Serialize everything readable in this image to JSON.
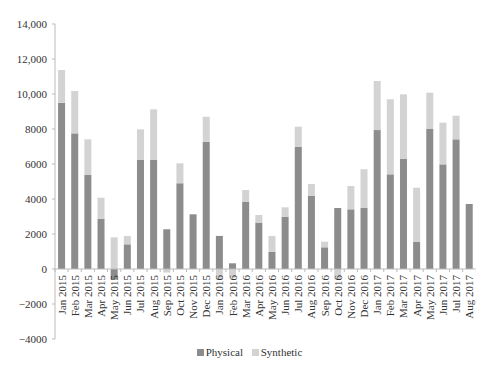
{
  "chart_data": {
    "type": "bar",
    "stacked": true,
    "title": "",
    "xlabel": "",
    "ylabel": "",
    "ylim": [
      -4000,
      14000
    ],
    "yticks": [
      -4000,
      -2000,
      0,
      2000,
      4000,
      6000,
      8000,
      10000,
      12000,
      14000
    ],
    "ytick_labels": [
      "−4000",
      "−2000",
      "0",
      "2000",
      "4000",
      "6000",
      "8000",
      "10,000",
      "12,000",
      "14,000"
    ],
    "grid": false,
    "legend_position": "bottom",
    "categories": [
      "Jan 2015",
      "Feb 2015",
      "Mar 2015",
      "Apr 2015",
      "May 2015",
      "Jun 2015",
      "Jul 2015",
      "Aug 2015",
      "Sep 2015",
      "Oct 2015",
      "Nov 2015",
      "Dec 2015",
      "Jan 2016",
      "Feb 2016",
      "Mar 2016",
      "Apr 2016",
      "May 2016",
      "Jun 2016",
      "Jul 2016",
      "Aug 2016",
      "Sep 2016",
      "Oct 2016",
      "Nov 2016",
      "Dec 2016",
      "Jan 2017",
      "Feb 2017",
      "Mar 2017",
      "Apr 2017",
      "May 2017",
      "Jun 2017",
      "Jul 2017",
      "Aug 2017"
    ],
    "series": [
      {
        "name": "Physical",
        "color": "#8c8c8c",
        "values": [
          9500,
          7750,
          5370,
          2860,
          -600,
          1410,
          6250,
          6250,
          2270,
          4900,
          3125,
          7275,
          1890,
          325,
          3850,
          2650,
          990,
          2990,
          6990,
          4190,
          1240,
          3485,
          3410,
          3485,
          7940,
          5410,
          6290,
          1560,
          8000,
          5980,
          7410,
          3715
        ]
      },
      {
        "name": "Synthetic",
        "color": "#d3d3d3",
        "values": [
          1870,
          2420,
          2040,
          1215,
          1810,
          480,
          1730,
          2875,
          -200,
          1140,
          0,
          1425,
          -600,
          -500,
          665,
          435,
          900,
          535,
          1140,
          670,
          320,
          -600,
          1330,
          2215,
          2800,
          4290,
          3690,
          3085,
          2075,
          2380,
          1350,
          0
        ]
      }
    ]
  },
  "legend": {
    "items": [
      {
        "label": "Physical",
        "color": "#8c8c8c"
      },
      {
        "label": "Synthetic",
        "color": "#d3d3d3"
      }
    ]
  }
}
